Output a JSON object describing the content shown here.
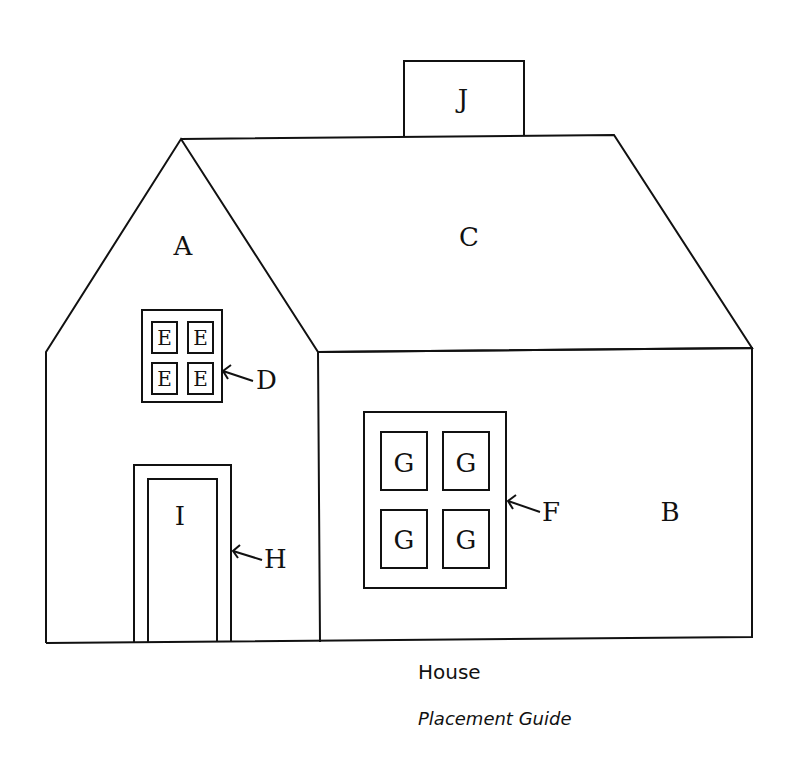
{
  "diagram": {
    "type": "placement-guide",
    "colors": {
      "line": "#111111",
      "background": "#ffffff"
    },
    "pieces": {
      "A": "A",
      "B": "B",
      "C": "C",
      "D": "D",
      "E": "E",
      "F": "F",
      "G": "G",
      "H": "H",
      "I": "I",
      "J": "J"
    }
  },
  "caption": {
    "title": "House",
    "subtitle": "Placement Guide"
  }
}
